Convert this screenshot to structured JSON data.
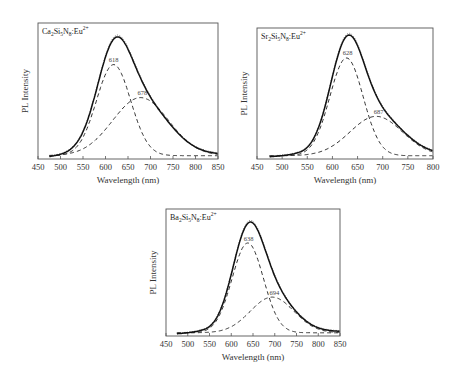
{
  "chart_data": [
    {
      "type": "line",
      "title": "Ca2Si5N8:Eu2+",
      "title_parts": {
        "main": "Ca",
        "s1": "2",
        "m2": "Si",
        "s2": "5",
        "m3": "N",
        "s3": "8",
        "m4": ":Eu",
        "sup": "2+"
      },
      "xlabel": "Wavelength (nm)",
      "ylabel": "PL Intensity",
      "xlim": [
        450,
        850
      ],
      "ylim": [
        0,
        1
      ],
      "xticks": [
        450,
        500,
        550,
        600,
        650,
        700,
        750,
        800,
        850
      ],
      "x_start": 475,
      "series": [
        {
          "name": "Measured",
          "style": "solid"
        },
        {
          "name": "Fit sum",
          "style": "dotted"
        },
        {
          "name": "Component 618",
          "style": "dashed",
          "center": 618,
          "amplitude": 0.69,
          "width": 38
        },
        {
          "name": "Component 678",
          "style": "dashed",
          "center": 678,
          "amplitude": 0.44,
          "width": 62
        }
      ],
      "annotations": [
        {
          "text": "618",
          "x": 618,
          "y": 0.72
        },
        {
          "text": "678",
          "x": 682,
          "y": 0.47
        }
      ],
      "total_peak": 0.91
    },
    {
      "type": "line",
      "title": "Sr2Si5N8:Eu2+",
      "title_parts": {
        "main": "Sr",
        "s1": "2",
        "m2": "Si",
        "s2": "5",
        "m3": "N",
        "s3": "8",
        "m4": ":Eu",
        "sup": "2+"
      },
      "xlabel": "Wavelength (nm)",
      "ylabel": "PL Intensity",
      "xlim": [
        450,
        800
      ],
      "ylim": [
        0,
        1
      ],
      "xticks": [
        450,
        500,
        550,
        600,
        650,
        700,
        750,
        800
      ],
      "x_start": 475,
      "series": [
        {
          "name": "Measured",
          "style": "solid"
        },
        {
          "name": "Fit sum",
          "style": "dotted"
        },
        {
          "name": "Component 628",
          "style": "dashed",
          "center": 628,
          "amplitude": 0.77,
          "width": 33
        },
        {
          "name": "Component 687",
          "style": "dashed",
          "center": 687,
          "amplitude": 0.31,
          "width": 52
        }
      ],
      "annotations": [
        {
          "text": "628",
          "x": 630,
          "y": 0.8
        },
        {
          "text": "687",
          "x": 692,
          "y": 0.34
        }
      ],
      "total_peak": 0.96
    },
    {
      "type": "line",
      "title": "Ba2Si5N8:Eu2+",
      "title_parts": {
        "main": "Ba",
        "s1": "2",
        "m2": "Si",
        "s2": "5",
        "m3": "N",
        "s3": "8",
        "m4": ":Eu",
        "sup": "2+"
      },
      "xlabel": "Wavelength (nm)",
      "ylabel": "PL Intensity",
      "xlim": [
        450,
        850
      ],
      "ylim": [
        0,
        1
      ],
      "xticks": [
        450,
        500,
        550,
        600,
        650,
        700,
        750,
        800,
        850
      ],
      "x_start": 475,
      "series": [
        {
          "name": "Measured",
          "style": "solid"
        },
        {
          "name": "Fit sum",
          "style": "dotted"
        },
        {
          "name": "Component 638",
          "style": "dashed",
          "center": 638,
          "amplitude": 0.73,
          "width": 36
        },
        {
          "name": "Component 694",
          "style": "dashed",
          "center": 694,
          "amplitude": 0.29,
          "width": 50
        }
      ],
      "annotations": [
        {
          "text": "638",
          "x": 640,
          "y": 0.76
        },
        {
          "text": "694",
          "x": 699,
          "y": 0.32
        }
      ],
      "total_peak": 0.91
    }
  ]
}
